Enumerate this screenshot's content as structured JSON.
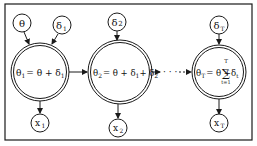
{
  "diagram": {
    "type": "state-space model graph",
    "stroke_color": "#1a1a1a",
    "background": "#ffffff",
    "inputs": [
      {
        "id": "theta",
        "label": "θ"
      },
      {
        "id": "delta1",
        "label": "δ",
        "sub": "1"
      },
      {
        "id": "delta2",
        "label": "δ",
        "sub": "2"
      },
      {
        "id": "deltaT",
        "label": "δ",
        "sub": "T"
      }
    ],
    "states": [
      {
        "id": "theta1",
        "lhs": "θ",
        "lhs_sub": "1",
        "rhs": "= θ + δ",
        "rhs_sub": "1"
      },
      {
        "id": "theta2",
        "lhs": "θ",
        "lhs_sub": "2",
        "rhs": "= θ + δ",
        "rhs_sub1": "1",
        "rhs_mid": "+ δ",
        "rhs_sub2": "2"
      },
      {
        "id": "thetaT",
        "lhs": "θ",
        "lhs_sub": "T",
        "rhs": "= θ +",
        "sum_top": "T",
        "sum_sym": "∑",
        "sum_bottom": "t=1",
        "term": "δ",
        "term_sub": "t"
      }
    ],
    "outputs": [
      {
        "id": "x1",
        "label": "x",
        "sub": "1"
      },
      {
        "id": "x2",
        "label": "x",
        "sub": "2"
      },
      {
        "id": "xT",
        "label": "x",
        "sub": "T"
      }
    ],
    "ellipsis": "· · ·"
  }
}
